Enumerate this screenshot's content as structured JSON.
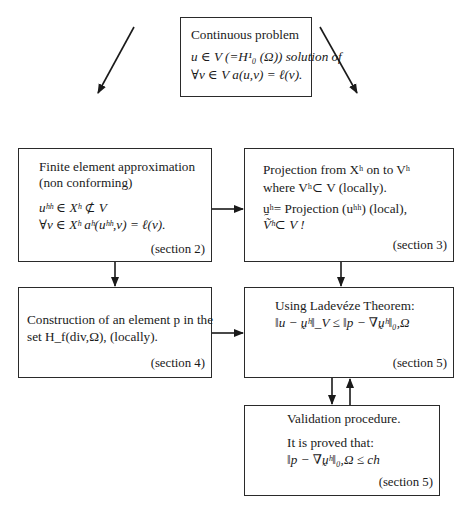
{
  "diagram": {
    "boxes": {
      "continuous": {
        "title": "Continuous problem",
        "line1": "u ∈ V (=H¹₀ (Ω)) solution of",
        "line2": "∀v ∈ V  a(u,v) = ℓ(v)."
      },
      "fe_approx": {
        "title": "Finite element approximation",
        "subtitle": "(non conforming)",
        "line1": "uʰʰ ∈ Xʰ ⊄ V",
        "line2": "∀v ∈ Xʰ  aʰ(uʰʰ,v) = ℓ(v).",
        "section": "(section 2)"
      },
      "projection": {
        "title": "Projection from Xʰ on to Vʰ",
        "line1": "where Vʰ⊂ V (locally).",
        "line2": "ṵʰ= Projection (uʰʰ) (local),",
        "line3": "Ṽʰ⊂ V !",
        "section": "(section 3)"
      },
      "construction": {
        "line1": "Construction of an element p in the",
        "line2": "set H_f(div,Ω), (locally).",
        "section": "(section 4)"
      },
      "ladeveze": {
        "title": "Using Ladevéze Theorem:",
        "line1": "‖u − ṵʰ‖_V ≤ ‖p − ∇ṵʰ‖₀,Ω",
        "section": "(section 5)"
      },
      "validation": {
        "title": "Validation procedure.",
        "line1": "It is proved that:",
        "line2": "‖p − ∇ṵʰ‖₀,Ω ≤ ch",
        "section": "(section 5)"
      }
    },
    "edges": [
      {
        "from": "continuous",
        "to": "fe_approx"
      },
      {
        "from": "continuous",
        "to": "projection"
      },
      {
        "from": "fe_approx",
        "to": "projection"
      },
      {
        "from": "fe_approx",
        "to": "construction"
      },
      {
        "from": "projection",
        "to": "ladeveze"
      },
      {
        "from": "construction",
        "to": "ladeveze"
      },
      {
        "from": "ladeveze",
        "to": "validation"
      },
      {
        "from": "validation",
        "to": "ladeveze"
      }
    ]
  }
}
